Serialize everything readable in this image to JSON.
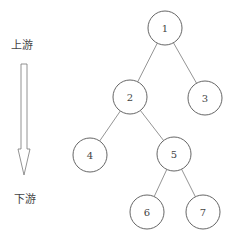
{
  "labels": {
    "upstream": "上游",
    "downstream": "下游"
  },
  "tree": {
    "nodes": [
      {
        "id": "1",
        "label": "1",
        "cx": 165,
        "cy": 28
      },
      {
        "id": "2",
        "label": "2",
        "cx": 130,
        "cy": 97
      },
      {
        "id": "3",
        "label": "3",
        "cx": 205,
        "cy": 98
      },
      {
        "id": "4",
        "label": "4",
        "cx": 90,
        "cy": 155
      },
      {
        "id": "5",
        "label": "5",
        "cx": 174,
        "cy": 154
      },
      {
        "id": "6",
        "label": "6",
        "cx": 147,
        "cy": 212
      },
      {
        "id": "7",
        "label": "7",
        "cx": 203,
        "cy": 212
      }
    ],
    "edges": [
      [
        "1",
        "2"
      ],
      [
        "1",
        "3"
      ],
      [
        "2",
        "4"
      ],
      [
        "2",
        "5"
      ],
      [
        "5",
        "6"
      ],
      [
        "5",
        "7"
      ]
    ]
  },
  "colors": {
    "stroke": "#555555",
    "text": "#444444"
  }
}
